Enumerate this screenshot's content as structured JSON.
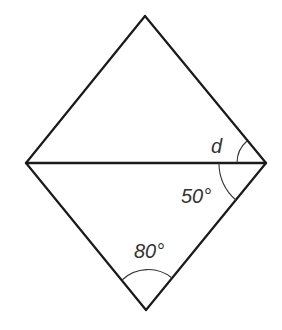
{
  "diagram": {
    "vertices": {
      "top": [
        145,
        16
      ],
      "left": [
        26,
        163
      ],
      "right": [
        266,
        163
      ],
      "bottom": [
        146,
        310
      ]
    },
    "stroke_color": "#1a1a1a",
    "labels": {
      "angle_d": "d",
      "angle_right_lower": "50°",
      "angle_bottom": "80°"
    }
  }
}
